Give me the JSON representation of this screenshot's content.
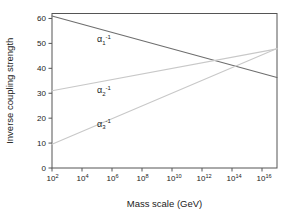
{
  "chart_data": {
    "type": "line",
    "title": "",
    "xlabel": "Mass scale (GeV)",
    "ylabel": "Inverse coupling strength",
    "xscale": "log",
    "xlim": [
      100,
      1e+17
    ],
    "ylim": [
      0,
      62
    ],
    "grid": false,
    "legend": "inline-labels",
    "xticks": [
      {
        "label": "10",
        "exponent": "2",
        "value": 100.0
      },
      {
        "label": "10",
        "exponent": "4",
        "value": 10000.0
      },
      {
        "label": "10",
        "exponent": "6",
        "value": 1000000.0
      },
      {
        "label": "10",
        "exponent": "8",
        "value": 100000000.0
      },
      {
        "label": "10",
        "exponent": "10",
        "value": 10000000000.0
      },
      {
        "label": "10",
        "exponent": "12",
        "value": 1000000000000.0
      },
      {
        "label": "10",
        "exponent": "14",
        "value": 100000000000000.0
      },
      {
        "label": "10",
        "exponent": "16",
        "value": 1e+16
      }
    ],
    "yticks": [
      0,
      10,
      20,
      30,
      40,
      50,
      60
    ],
    "series": [
      {
        "name": "alpha-1-inverse",
        "label_base": "α",
        "label_sub": "1",
        "label_sup": "-1",
        "color": "#6e6e6e",
        "x": [
          100.0,
          1e+17
        ],
        "values": [
          61.0,
          36.3
        ],
        "label_x": 100000.0,
        "label_y": 50.5
      },
      {
        "name": "alpha-2-inverse",
        "label_base": "α",
        "label_sub": "2",
        "label_sup": "-1",
        "color": "#c8c8c8",
        "x": [
          100.0,
          1e+17
        ],
        "values": [
          31.0,
          47.8
        ],
        "label_x": 100000.0,
        "label_y": 30.0
      },
      {
        "name": "alpha-3-inverse",
        "label_base": "α",
        "label_sub": "3",
        "label_sup": "-1",
        "color": "#c8c8c8",
        "x": [
          100.0,
          1e+17
        ],
        "values": [
          9.5,
          48.0
        ],
        "label_x": 100000.0,
        "label_y": 16.5
      }
    ],
    "unification_crossing": {
      "x": 20000000000000.0,
      "y": 40.5
    }
  },
  "axes": {
    "x_axis_title": "Mass scale (GeV)",
    "y_axis_title": "Inverse coupling strength",
    "frame_color": "#555555"
  }
}
